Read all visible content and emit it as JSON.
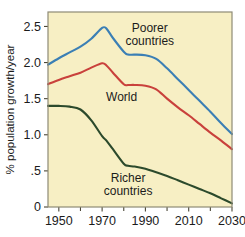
{
  "chart_data": {
    "type": "line",
    "title": "",
    "xlabel": "",
    "ylabel": "% population growth/year",
    "xlim": [
      1945,
      2030
    ],
    "ylim": [
      0,
      2.7
    ],
    "grid": false,
    "legend_position": "inline-annotations",
    "background_color": "#f7efc4",
    "x_ticks": [
      1950,
      1970,
      1990,
      2010,
      2030
    ],
    "x_tick_labels": [
      "1950",
      "1970",
      "1990",
      "2010",
      "2030"
    ],
    "x_minor_ticks": [
      1960,
      1980,
      2000,
      2020
    ],
    "y_ticks": [
      0,
      0.5,
      1.0,
      1.5,
      2.0,
      2.5
    ],
    "y_tick_labels": [
      "0",
      ".5",
      "1.0",
      "1.5",
      "2.0",
      "2.5"
    ],
    "x": [
      1945,
      1950,
      1955,
      1960,
      1965,
      1970,
      1972,
      1975,
      1980,
      1982,
      1985,
      1990,
      1995,
      2000,
      2005,
      2010,
      2015,
      2020,
      2025,
      2030
    ],
    "series": [
      {
        "name": "Poorer countries",
        "color": "#3b7fb5",
        "label_x": 1992,
        "label_y": 2.42,
        "values": [
          1.97,
          2.06,
          2.14,
          2.22,
          2.33,
          2.48,
          2.47,
          2.34,
          2.15,
          2.11,
          2.11,
          2.1,
          2.05,
          1.92,
          1.77,
          1.62,
          1.47,
          1.32,
          1.16,
          1.01
        ]
      },
      {
        "name": "World",
        "color": "#c9413c",
        "label_x": 1979,
        "label_y": 1.47,
        "values": [
          1.7,
          1.76,
          1.81,
          1.86,
          1.93,
          1.99,
          1.96,
          1.86,
          1.7,
          1.69,
          1.69,
          1.68,
          1.63,
          1.5,
          1.38,
          1.27,
          1.15,
          1.03,
          0.92,
          0.8
        ]
      },
      {
        "name": "Richer countries",
        "color": "#2c4a2c",
        "label_x": 1982,
        "label_y": 0.34,
        "values": [
          1.4,
          1.4,
          1.39,
          1.35,
          1.2,
          0.98,
          0.92,
          0.8,
          0.6,
          0.57,
          0.56,
          0.53,
          0.48,
          0.43,
          0.37,
          0.31,
          0.25,
          0.19,
          0.12,
          0.05
        ]
      }
    ]
  }
}
